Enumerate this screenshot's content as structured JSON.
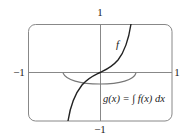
{
  "figure": {
    "axes": {
      "x_min_label": "−1",
      "x_max_label": "1",
      "y_max_label": "1",
      "y_min_label": "−1",
      "xlim": [
        -1,
        1
      ],
      "ylim": [
        -1,
        1
      ]
    },
    "curves": [
      {
        "name": "f",
        "label": "f",
        "color": "#222222",
        "description": "increasing curve through origin, steep near ±1 (tan-like)"
      },
      {
        "name": "g",
        "label": "g(x) = ∫ f(x) dx",
        "color": "#777777",
        "description": "bowl-shaped antiderivative with minimum at origin, below x-axis"
      }
    ],
    "colors": {
      "frame": "#888888",
      "axes": "#888888",
      "f_curve": "#222222",
      "g_curve": "#777777"
    }
  }
}
